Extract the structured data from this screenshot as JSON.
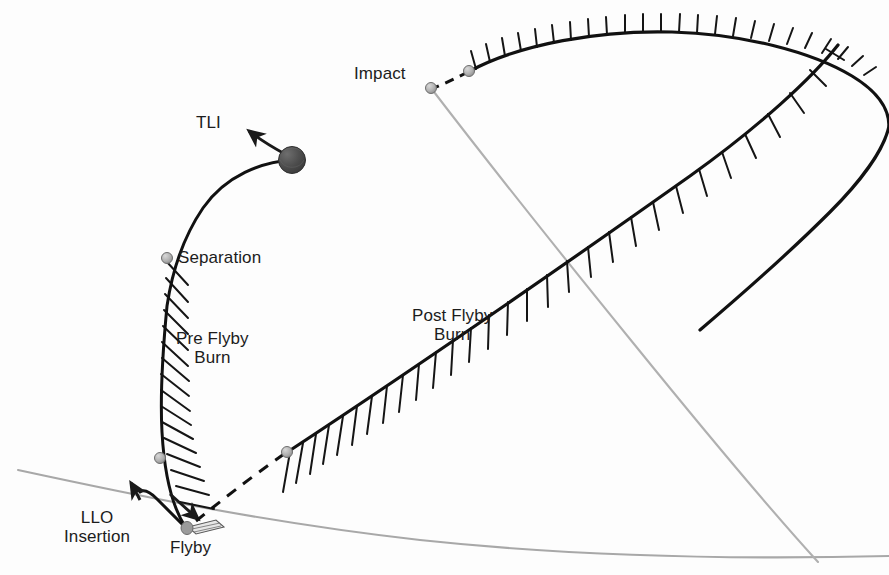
{
  "figure": {
    "type": "trajectory-diagram",
    "background_color": "#fdfdfd"
  },
  "colors": {
    "trajectory_stroke": "#111111",
    "surface_arc_stroke": "#a8a8a8",
    "marker_fill": "#b0b0b0",
    "marker_stroke": "#6e6e6e",
    "body_fill": "#4a4a4a",
    "text": "#1c1c1c"
  },
  "labels": {
    "tli": {
      "text": "TLI",
      "x": 196,
      "y": 124
    },
    "separation": {
      "text": "Separation",
      "x": 178,
      "y": 247
    },
    "pre_flyby_burn": {
      "text": "Pre Flyby\nBurn",
      "x": 176,
      "y": 330
    },
    "llo_insertion": {
      "text": "LLO\nInsertion",
      "x": 66,
      "y": 519
    },
    "flyby": {
      "text": "Flyby",
      "x": 172,
      "y": 542
    },
    "impact": {
      "text": "Impact",
      "x": 355,
      "y": 66
    },
    "post_flyby_burn": {
      "text": "Post Flyby\nBurn",
      "x": 413,
      "y": 307
    }
  },
  "markers": [
    {
      "name": "separation-marker",
      "x": 167,
      "y": 258,
      "r": 5.5,
      "kind": "sphere"
    },
    {
      "name": "pre-flyby-burn-end-marker",
      "x": 158,
      "y": 458,
      "r": 5.5,
      "kind": "sphere"
    },
    {
      "name": "flyby-marker",
      "x": 184,
      "y": 528,
      "r": 6.0,
      "kind": "sphere"
    },
    {
      "name": "post-flyby-burn-start-marker",
      "x": 287,
      "y": 452,
      "r": 5.5,
      "kind": "sphere"
    },
    {
      "name": "impact-marker",
      "x": 431,
      "y": 88,
      "r": 5.5,
      "kind": "sphere"
    },
    {
      "name": "impact-burn-start-marker",
      "x": 468,
      "y": 72,
      "r": 5.5,
      "kind": "sphere"
    },
    {
      "name": "earth-body",
      "x": 292,
      "y": 160,
      "r": 13.5,
      "kind": "body"
    }
  ],
  "paths": {
    "tli_ascent": "M 292 160 C 270 161, 232 172, 206 205 C 186 232, 172 268, 167 300",
    "pre_flyby_descent": "M 167 258 C 163 300, 160 360, 162 420 C 163 460, 168 500, 184 528",
    "llo_curl": "M 184 528 C 176 520, 166 510, 158 500 C 150 491, 144 487, 138 489",
    "flyby_to_burn_dashed": "M 192 524 C 215 505, 250 478, 287 452",
    "post_flyby_ascent": "M 287 452 C 400 378, 560 268, 700 170 C 770 120, 820 70, 840 46",
    "loop_top": "M 840 46 C 800 32, 700 26, 620 30 C 560 33, 505 48, 468 72",
    "impact_dashed": "M 468 72 C 455 78, 443 84, 431 88",
    "impact_gray_descent": "M 431 88 C 480 150, 560 250, 640 350 C 700 425, 760 500, 820 560",
    "surface_arc": "M 18 470 C 120 492, 260 522, 420 540 C 560 555, 720 560, 889 556"
  },
  "hatching": {
    "pre_flyby": {
      "count": 13,
      "label": "burn hatch marks along pre-flyby descent"
    },
    "post_flyby": {
      "count": 22,
      "label": "burn hatch marks along post-flyby ascent"
    },
    "loop_top": {
      "count": 13,
      "label": "burn hatch marks along upper loop"
    }
  },
  "arrows": [
    {
      "name": "tli-arrow",
      "from": [
        288,
        155
      ],
      "to": [
        247,
        128
      ],
      "label": "TLI"
    },
    {
      "name": "llo-insertion-arrow",
      "from": [
        146,
        508
      ],
      "to": [
        131,
        481
      ],
      "label": "LLO Insertion"
    },
    {
      "name": "flyby-approach-arrow",
      "from": [
        172,
        498
      ],
      "to": [
        196,
        517
      ],
      "label": "Flyby"
    }
  ]
}
